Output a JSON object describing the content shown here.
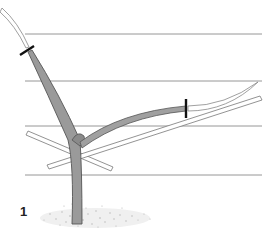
{
  "figure": {
    "label": "1",
    "colors": {
      "wire": "#8a8a8a",
      "trunk_fill": "#9a9a9a",
      "trunk_outline": "#555555",
      "shoot_outline": "#777777",
      "cut_mark": "#111111",
      "ground": "#bdbdbd"
    },
    "wires_y": [
      34,
      81,
      126,
      175
    ],
    "cut_marks": [
      {
        "name": "leader-cut",
        "x": 27,
        "y": 50
      },
      {
        "name": "branch-cut",
        "x": 186,
        "y": 109
      }
    ]
  }
}
